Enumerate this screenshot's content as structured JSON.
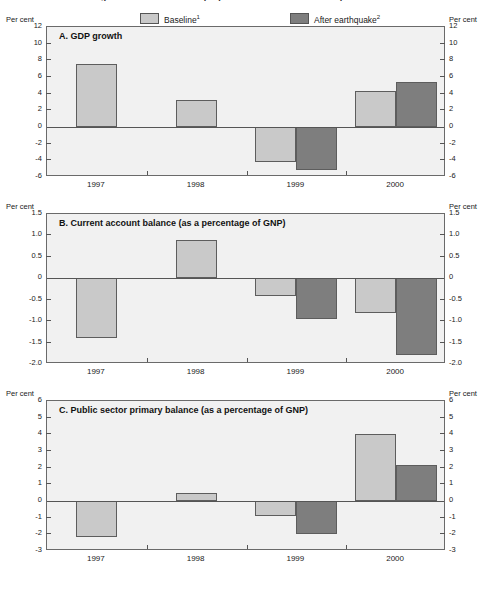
{
  "figure": {
    "title_cut": "Figure 1. Macroeconomic projections: baseline and earthquake scenarios",
    "unit_label": "Per cent"
  },
  "legend": {
    "baseline": {
      "label": "Baseline",
      "footnote": "1",
      "color": "#c9c9c9",
      "name": "baseline-swatch"
    },
    "after": {
      "label": "After earthquake",
      "footnote": "2",
      "color": "#7e7e7e",
      "name": "after-earthquake-swatch"
    }
  },
  "categories": [
    "1997",
    "1998",
    "1999",
    "2000"
  ],
  "chart_data": [
    {
      "type": "bar",
      "panel": "A",
      "title": "A.   GDP growth",
      "categories": [
        "1997",
        "1998",
        "1999",
        "2000"
      ],
      "series": [
        {
          "name": "Baseline",
          "values": [
            7.6,
            3.2,
            -4.2,
            4.3
          ],
          "color": "#c9c9c9"
        },
        {
          "name": "After earthquake",
          "values": [
            null,
            null,
            -5.1,
            5.4
          ],
          "color": "#7e7e7e"
        }
      ],
      "ylabel": "Per cent",
      "xlabel": "",
      "ylim": [
        -6,
        12
      ],
      "yticks": [
        12,
        10,
        8,
        6,
        4,
        2,
        0,
        -2,
        -4,
        -6
      ],
      "ytick_labels": [
        "12",
        "10",
        "8",
        "6",
        "4",
        "2",
        "0",
        "-2",
        "-4",
        "-6"
      ],
      "grid": false,
      "legend_position": "top"
    },
    {
      "type": "bar",
      "panel": "B",
      "title": "B.   Current account balance (as a percentage of GNP)",
      "categories": [
        "1997",
        "1998",
        "1999",
        "2000"
      ],
      "series": [
        {
          "name": "Baseline",
          "values": [
            -1.4,
            0.9,
            -0.42,
            -0.8
          ],
          "color": "#c9c9c9"
        },
        {
          "name": "After earthquake",
          "values": [
            null,
            null,
            -0.95,
            -1.8
          ],
          "color": "#7e7e7e"
        }
      ],
      "ylabel": "Per cent",
      "xlabel": "",
      "ylim": [
        -2.0,
        1.5
      ],
      "yticks": [
        1.5,
        1.0,
        0.5,
        0,
        -0.5,
        -1.0,
        -1.5,
        -2.0
      ],
      "ytick_labels": [
        "1.5",
        "1.0",
        "0.5",
        "0",
        "-0.5",
        "-1.0",
        "-1.5",
        "-2.0"
      ],
      "grid": false,
      "legend_position": "top"
    },
    {
      "type": "bar",
      "panel": "C",
      "title": "C.   Public sector primary balance (as a percentage of GNP)",
      "categories": [
        "1997",
        "1998",
        "1999",
        "2000"
      ],
      "series": [
        {
          "name": "Baseline",
          "values": [
            -2.15,
            0.5,
            -0.9,
            4.05
          ],
          "color": "#c9c9c9"
        },
        {
          "name": "After earthquake",
          "values": [
            null,
            null,
            -2.0,
            2.15
          ],
          "color": "#7e7e7e"
        }
      ],
      "ylabel": "Per cent",
      "xlabel": "",
      "ylim": [
        -3,
        6
      ],
      "yticks": [
        6,
        5,
        4,
        3,
        2,
        1,
        0,
        -1,
        -2,
        -3
      ],
      "ytick_labels": [
        "6",
        "5",
        "4",
        "3",
        "2",
        "1",
        "0",
        "-1",
        "-2",
        "-3"
      ],
      "grid": false,
      "legend_position": "top"
    }
  ]
}
